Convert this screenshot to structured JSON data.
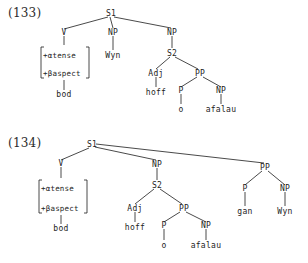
{
  "document": {
    "kind": "syntactic-tree-figures",
    "background_color": "#ffffff",
    "ink_color": "#1c1c1c"
  },
  "examples": [
    {
      "id": "133",
      "number_label": "(133)",
      "root": "S1",
      "nodes": {
        "root": "S1",
        "v": "V",
        "np_subject": "NP",
        "np_object": "NP",
        "s2": "S2",
        "adj": "Adj",
        "pp": "PP",
        "p": "P",
        "np_complement": "NP"
      },
      "feature_matrix": {
        "line1": "+αtense",
        "line2": "+βaspect"
      },
      "terminals": {
        "verb": "bod",
        "subject": "Wyn",
        "adjective": "hoff",
        "preposition": "o",
        "object": "afalau"
      }
    },
    {
      "id": "134",
      "number_label": "(134)",
      "root": "S1",
      "nodes": {
        "root": "S1",
        "v": "V",
        "np_predicate": "NP",
        "s2": "S2",
        "adj": "Adj",
        "pp_inner": "PP",
        "p_inner": "P",
        "np_inner": "NP",
        "pp_outer": "PP",
        "p_outer": "P",
        "np_outer": "NP"
      },
      "feature_matrix": {
        "line1": "+αtense",
        "line2": "+βaspect"
      },
      "terminals": {
        "verb": "bod",
        "adjective": "hoff",
        "preposition_inner": "o",
        "object_inner": "afalau",
        "preposition_outer": "gan",
        "object_outer": "Wyn"
      }
    }
  ]
}
